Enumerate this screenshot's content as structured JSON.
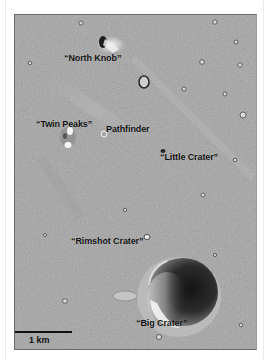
{
  "figure": {
    "type": "annotated orbital image",
    "labels": [
      {
        "id": "north-knob",
        "text": "“North Knob”",
        "x": 63,
        "y": 52
      },
      {
        "id": "twin-peaks",
        "text": "“Twin Peaks”",
        "x": 22,
        "y": 102
      },
      {
        "id": "pathfinder",
        "text": "Pathfinder",
        "x": 92,
        "y": 109
      },
      {
        "id": "little-crater",
        "text": "“Little Crater”",
        "x": 145,
        "y": 137
      },
      {
        "id": "rimshot-crater",
        "text": "“Rimshot Crater”",
        "x": 56,
        "y": 221
      },
      {
        "id": "big-crater",
        "text": "“Big Crater”",
        "x": 132,
        "y": 304
      }
    ],
    "scale_bar": {
      "label": "1 km",
      "length_px": 58
    },
    "colors": {
      "terrain": "#a9a9a9",
      "shadow": "#1a1a1a",
      "highlight": "#f2f2f2",
      "label_text": "#111111"
    }
  }
}
